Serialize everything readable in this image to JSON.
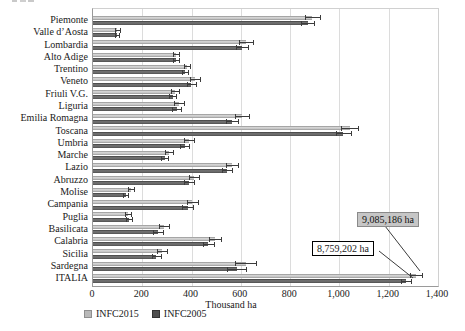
{
  "chart_data": {
    "type": "bar",
    "orientation": "horizontal",
    "title": "",
    "xlabel": "Thousand ha",
    "xlim": [
      0,
      1400
    ],
    "xticks": [
      0,
      200,
      400,
      600,
      800,
      1000,
      1200,
      1400
    ],
    "xtick_labels": [
      "0",
      "200",
      "400",
      "600",
      "800",
      "1,000",
      "1,200",
      "1,400"
    ],
    "grid": "vertical-gridlines",
    "legend_position": "bottom",
    "categories": [
      "Piemonte",
      "Valle d’Aosta",
      "Lombardia",
      "Alto Adige",
      "Trentino",
      "Veneto",
      "Friuli V.G.",
      "Liguria",
      "Emilia Romagna",
      "Toscana",
      "Umbria",
      "Marche",
      "Lazio",
      "Abruzzo",
      "Molise",
      "Campania",
      "Puglia",
      "Basilicata",
      "Calabria",
      "Sicilia",
      "Sardegna",
      "ITALIA"
    ],
    "series": [
      {
        "name": "INFC2015",
        "color": "#b9b9b9",
        "values": [
          890,
          99,
          620,
          338,
          381,
          414,
          332,
          348,
          605,
          1041,
          390,
          308,
          564,
          410,
          154,
          403,
          141,
          288,
          495,
          280,
          620,
          9085.186
        ],
        "errors": [
          30,
          9,
          28,
          13,
          13,
          20,
          15,
          20,
          28,
          33,
          20,
          16,
          25,
          22,
          11,
          23,
          13,
          22,
          24,
          20,
          42,
          25
        ]
      },
      {
        "name": "INFC2005",
        "color": "#595959",
        "values": [
          871,
          98,
          606,
          337,
          375,
          398,
          324,
          339,
          563,
          1016,
          372,
          291,
          544,
          391,
          133,
          384,
          146,
          263,
          468,
          256,
          583,
          8759.202
        ],
        "errors": [
          25,
          8,
          25,
          12,
          12,
          18,
          14,
          18,
          25,
          30,
          18,
          15,
          22,
          20,
          10,
          21,
          12,
          20,
          22,
          18,
          38,
          22
        ]
      }
    ],
    "italia_bars_clipped": true,
    "italia_display_values": {
      "INFC2015": 1310,
      "INFC2005": 1270
    },
    "annotations": [
      {
        "text": "9,085,186 ha",
        "series": "INFC2015",
        "target_category": "ITALIA",
        "style": "gray-filled-box"
      },
      {
        "text": "8,759,202 ha",
        "series": "INFC2005",
        "target_category": "ITALIA",
        "style": "white-box-black-border"
      }
    ]
  },
  "legend": {
    "items": [
      {
        "label": "INFC2015"
      },
      {
        "label": "INFC2005"
      }
    ]
  },
  "axis": {
    "x_title": "Thousand ha"
  }
}
